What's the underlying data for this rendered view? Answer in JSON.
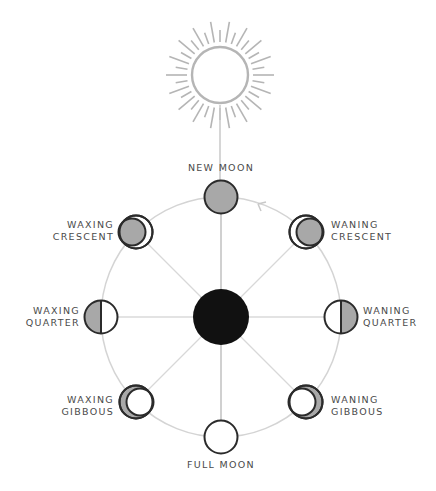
{
  "diagram": {
    "colors": {
      "line": "#c8c8c8",
      "sun": "#b5b5b5",
      "moon_outline": "#2b2b2b",
      "moon_shadow": "#a8a8a8",
      "moon_lit": "#ffffff",
      "earth": "#111111",
      "text": "#4a4a4a"
    },
    "labels": {
      "new_moon": "NEW MOON",
      "waxing_crescent_1": "WAXING",
      "waxing_crescent_2": "CRESCENT",
      "waning_crescent_1": "WANING",
      "waning_crescent_2": "CRESCENT",
      "waxing_quarter_1": "WAXING",
      "waxing_quarter_2": "QUARTER",
      "waning_quarter_1": "WANING",
      "waning_quarter_2": "QUARTER",
      "waxing_gibbous_1": "WAXING",
      "waxing_gibbous_2": "GIBBOUS",
      "waning_gibbous_1": "WANING",
      "waning_gibbous_2": "GIBBOUS",
      "full_moon": "FULL MOON"
    },
    "nodes": {
      "sun": "sun-icon",
      "earth": "earth-disc",
      "direction": "orbit-direction-arrow"
    }
  }
}
